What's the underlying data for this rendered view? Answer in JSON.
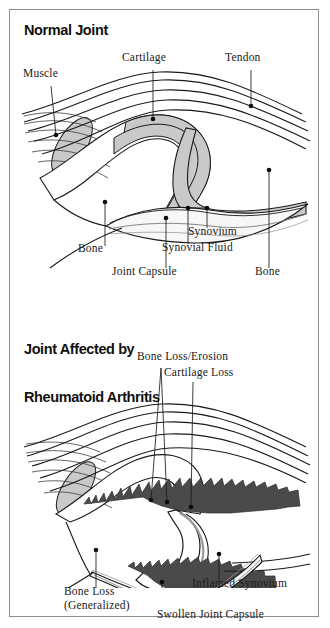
{
  "document": {
    "kind": "medical-illustration",
    "figure_caption_top": "Normal Joint",
    "figure_caption_bottom": "Joint Affected by\nRheumatoid Arthritis"
  },
  "colors": {
    "ink": "#1a1a1a",
    "frame": "#8d8d8d",
    "bone_fill": "#c9c9c9",
    "cartilage_fill": "#bdbdbd",
    "capsule_fill": "#f2f2f2",
    "inflamed_synovium_fill": "#4a4a4a",
    "page": "#ffffff"
  },
  "panels": [
    {
      "id": "normal-joint",
      "title": "Normal Joint",
      "labels": [
        {
          "id": "muscle",
          "text": "Muscle",
          "x": 22,
          "y": 64
        },
        {
          "id": "cartilage",
          "text": "Cartilage",
          "x": 120,
          "y": 48
        },
        {
          "id": "tendon",
          "text": "Tendon",
          "x": 223,
          "y": 48
        },
        {
          "id": "bone-left",
          "text": "Bone",
          "x": 77,
          "y": 239
        },
        {
          "id": "synovium",
          "text": "Synovium",
          "x": 186,
          "y": 222
        },
        {
          "id": "synovial-fluid",
          "text": "Synovial Fluid",
          "x": 160,
          "y": 238
        },
        {
          "id": "joint-capsule",
          "text": "Joint Capsule",
          "x": 110,
          "y": 262
        },
        {
          "id": "bone-right",
          "text": "Bone",
          "x": 253,
          "y": 262
        }
      ]
    },
    {
      "id": "rheumatoid-arthritis-joint",
      "title_line1": "Joint Affected by",
      "title_line2": "Rheumatoid Arthritis",
      "labels": [
        {
          "id": "bone-loss-erosion",
          "text": "Bone Loss/Erosion",
          "x": 135,
          "y": 347
        },
        {
          "id": "cartilage-loss",
          "text": "Cartilage Loss",
          "x": 162,
          "y": 363
        },
        {
          "id": "bone-loss",
          "text": "Bone Loss",
          "x": 62,
          "y": 582
        },
        {
          "id": "bone-loss-generalized",
          "text": "(Generalized)",
          "x": 62,
          "y": 596
        },
        {
          "id": "inflamed-synovium",
          "text": "Inflamed Synovium",
          "x": 190,
          "y": 574
        },
        {
          "id": "swollen-joint-capsule",
          "text": "Swollen Joint Capsule",
          "x": 155,
          "y": 605
        }
      ]
    }
  ],
  "anatomy_terms": [
    "Muscle",
    "Cartilage",
    "Tendon",
    "Bone",
    "Synovium",
    "Synovial Fluid",
    "Joint Capsule",
    "Bone Loss/Erosion",
    "Cartilage Loss",
    "Bone Loss",
    "(Generalized)",
    "Inflamed Synovium",
    "Swollen Joint Capsule"
  ]
}
